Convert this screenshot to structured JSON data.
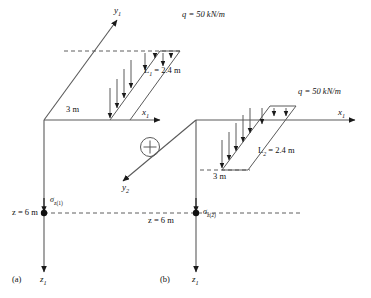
{
  "figure": {
    "caption_a": "(a)",
    "caption_b": "(b)",
    "operator": "+"
  },
  "colors": {
    "line": "#5a5a5a",
    "dark": "#1a1a1a",
    "dashed": "#4d4d4d",
    "text": "#111111"
  },
  "panel_a": {
    "axis_y_label": "y",
    "axis_y_sub": "1",
    "axis_x_label": "x",
    "axis_x_sub": "1",
    "axis_z_label": "z",
    "axis_z_sub": "1",
    "offset_label": "3 m",
    "load_label": "q = 50 kN/m",
    "length_label": "L",
    "length_sub": "1",
    "length_value": "= 2.4 m",
    "depth_label": "z = 6 m",
    "stress_label": "σ",
    "stress_sub": "z(1)"
  },
  "panel_b": {
    "axis_y_label": "y",
    "axis_y_sub": "2",
    "axis_x_label": "x",
    "axis_x_sub": "1",
    "axis_z_label": "z",
    "axis_z_sub": "1",
    "offset_label": "3 m",
    "load_label": "q = 50 kN/m",
    "length_label": "L",
    "length_sub": "2",
    "length_value": "= 2.4 m",
    "depth_label": "z = 6 m",
    "stress_label": "σ",
    "stress_sub": "z(2)"
  }
}
